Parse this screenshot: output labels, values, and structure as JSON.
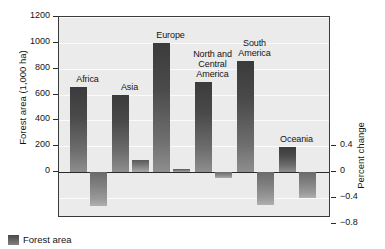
{
  "chart_data": {
    "type": "bar",
    "title": "",
    "subtitle": "",
    "categories": [
      "Africa",
      "Asia",
      "Europe",
      "North and\nCentral\nAmerica",
      "South\nAmerica",
      "Oceania"
    ],
    "series": [
      {
        "name": "Forest area",
        "unit": "1,000 ha",
        "axis": "left",
        "values": [
          660,
          600,
          1000,
          700,
          860,
          190
        ]
      },
      {
        "name": "Percent change",
        "unit": "percent",
        "axis": "right",
        "values": [
          -0.52,
          0.19,
          0.05,
          -0.1,
          -0.51,
          -0.41
        ]
      }
    ],
    "ylabel": "Forest area (1,000 ha)",
    "ylabel_right": "Percent change",
    "xlabel": "",
    "ylim": [
      0,
      1200
    ],
    "ylim_right": [
      -0.8,
      0.4
    ],
    "yticks": [
      0,
      200,
      400,
      600,
      800,
      1000,
      1200
    ],
    "yticks_right": [
      0.4,
      0,
      -0.4,
      -0.8
    ],
    "ytick_labels": [
      "0",
      "200",
      "400",
      "600",
      "800",
      "1000",
      "1200"
    ],
    "ytick_labels_right": [
      "0.4",
      "0",
      "−0.4",
      "−0.8"
    ],
    "grid": true,
    "legend_position": "bottom-left",
    "legend": [
      "Forest area"
    ],
    "colors": {
      "plot_background": "#ebebeb",
      "grid": "#fbfbfb",
      "axis": "#2b2b2b",
      "bar_forest_top": "#3b3b3b",
      "bar_forest_bottom": "#8e8e8e",
      "bar_percent_top": "#6a6a6a",
      "bar_percent_bottom": "#b0b0b0",
      "text": "#141414"
    }
  },
  "legend": {
    "forest_area_label": "Forest area"
  }
}
